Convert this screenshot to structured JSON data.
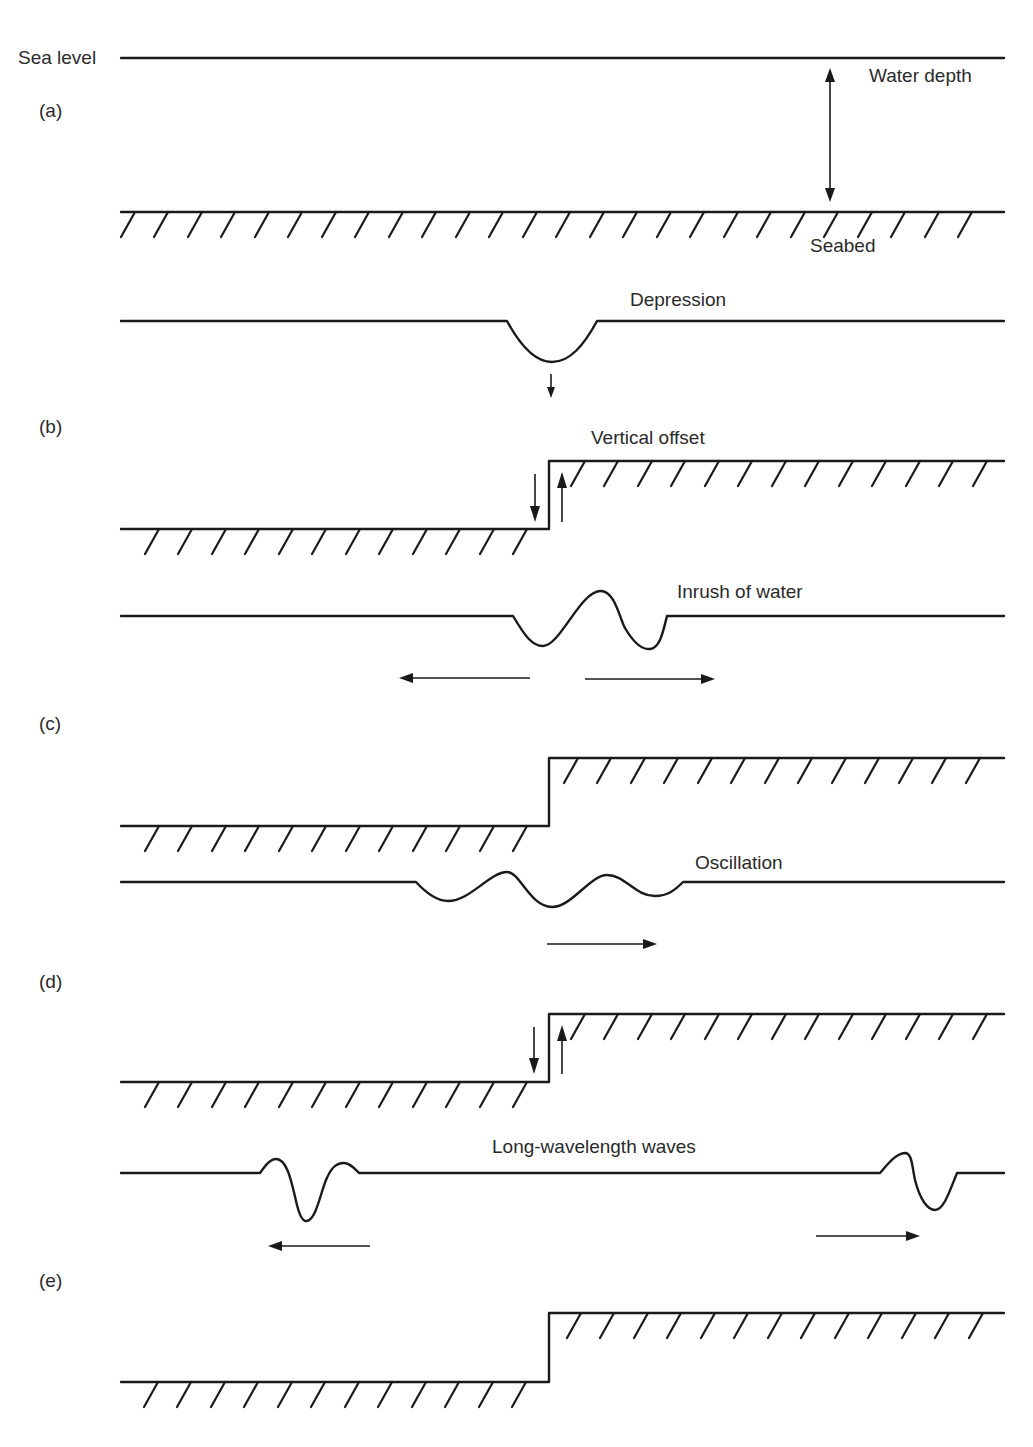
{
  "figure": {
    "labels": {
      "sea_level": "Sea level",
      "water_depth": "Water depth",
      "seabed": "Seabed",
      "depression": "Depression",
      "vertical_offset": "Vertical offset",
      "inrush": "Inrush of water",
      "oscillation": "Oscillation",
      "long_waves": "Long-wavelength waves"
    },
    "panels": [
      {
        "id": "a",
        "label": "(a)",
        "caption": "Undisturbed sea with water depth between sea level and seabed"
      },
      {
        "id": "b",
        "label": "(b)",
        "caption": "Vertical offset of seabed produces depression at sea surface"
      },
      {
        "id": "c",
        "label": "(c)",
        "caption": "Inrush of water; disturbance spreads both ways"
      },
      {
        "id": "d",
        "label": "(d)",
        "caption": "Oscillation as seabed moves"
      },
      {
        "id": "e",
        "label": "(e)",
        "caption": "Long-wavelength waves travel outward in both directions"
      }
    ],
    "colors": {
      "ink": "#1a1a1a",
      "text": "#2a2a2a",
      "background": "#ffffff"
    },
    "geometry": {
      "hatch_spacing_px": 33.5,
      "fault_x": 548
    }
  }
}
